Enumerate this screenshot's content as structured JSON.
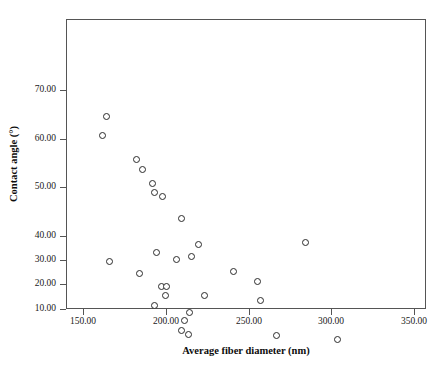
{
  "chart_data": {
    "type": "scatter",
    "title": "",
    "xlabel": "Average fiber diameter (nm)",
    "ylabel": "Contact angle (°)",
    "xlim": [
      133,
      350
    ],
    "ylim": [
      10,
      80
    ],
    "xticks": [
      150,
      200,
      250,
      300,
      350
    ],
    "xticklabels": [
      "150.00",
      "200.00",
      "250.00",
      "300.00",
      "350.00"
    ],
    "yticks": [
      10,
      20,
      30,
      40,
      50,
      60,
      70
    ],
    "yticklabels": [
      "10.00",
      "20.00",
      "30.00",
      "40.00",
      "50.00",
      "60.00",
      "70.00"
    ],
    "grid": false,
    "legend": null,
    "marker": "open-circle",
    "marker_color": "#2b2b2b",
    "series": [
      {
        "name": "Contact angle vs fiber diameter",
        "points": [
          {
            "x": 163.0,
            "y": 65.0
          },
          {
            "x": 160.5,
            "y": 61.0
          },
          {
            "x": 181.0,
            "y": 56.0
          },
          {
            "x": 185.0,
            "y": 54.0
          },
          {
            "x": 191.0,
            "y": 51.2
          },
          {
            "x": 192.0,
            "y": 49.2
          },
          {
            "x": 197.0,
            "y": 48.5
          },
          {
            "x": 208.5,
            "y": 44.0
          },
          {
            "x": 165.0,
            "y": 35.0
          },
          {
            "x": 193.0,
            "y": 37.0
          },
          {
            "x": 218.5,
            "y": 38.5
          },
          {
            "x": 205.0,
            "y": 35.5
          },
          {
            "x": 214.5,
            "y": 36.0
          },
          {
            "x": 183.0,
            "y": 32.5
          },
          {
            "x": 240.0,
            "y": 33.0
          },
          {
            "x": 196.0,
            "y": 29.8
          },
          {
            "x": 199.5,
            "y": 29.8
          },
          {
            "x": 198.5,
            "y": 28.0
          },
          {
            "x": 254.5,
            "y": 31.0
          },
          {
            "x": 222.0,
            "y": 28.0
          },
          {
            "x": 256.0,
            "y": 27.0
          },
          {
            "x": 192.0,
            "y": 26.0
          },
          {
            "x": 213.0,
            "y": 24.5
          },
          {
            "x": 210.0,
            "y": 22.8
          },
          {
            "x": 208.5,
            "y": 20.8
          },
          {
            "x": 212.5,
            "y": 20.0
          },
          {
            "x": 283.0,
            "y": 39.0
          },
          {
            "x": 266.0,
            "y": 19.8
          },
          {
            "x": 302.5,
            "y": 19.0
          }
        ]
      }
    ]
  },
  "axis": {
    "x_ticks": [
      {
        "label": "150.00",
        "px": 83
      },
      {
        "label": "200.00",
        "px": 166
      },
      {
        "label": "250.00",
        "px": 249
      },
      {
        "label": "300.00",
        "px": 331
      },
      {
        "label": "350.00",
        "px": 414
      }
    ],
    "y_ticks": [
      {
        "label": "70.00",
        "px": 90
      },
      {
        "label": "60.00",
        "px": 139
      },
      {
        "label": "50.00",
        "px": 187
      },
      {
        "label": "40.00",
        "px": 236
      },
      {
        "label": "30.00",
        "px": 260
      },
      {
        "label": "20.00",
        "px": 284
      },
      {
        "label": "10.00",
        "px": 309
      }
    ]
  }
}
